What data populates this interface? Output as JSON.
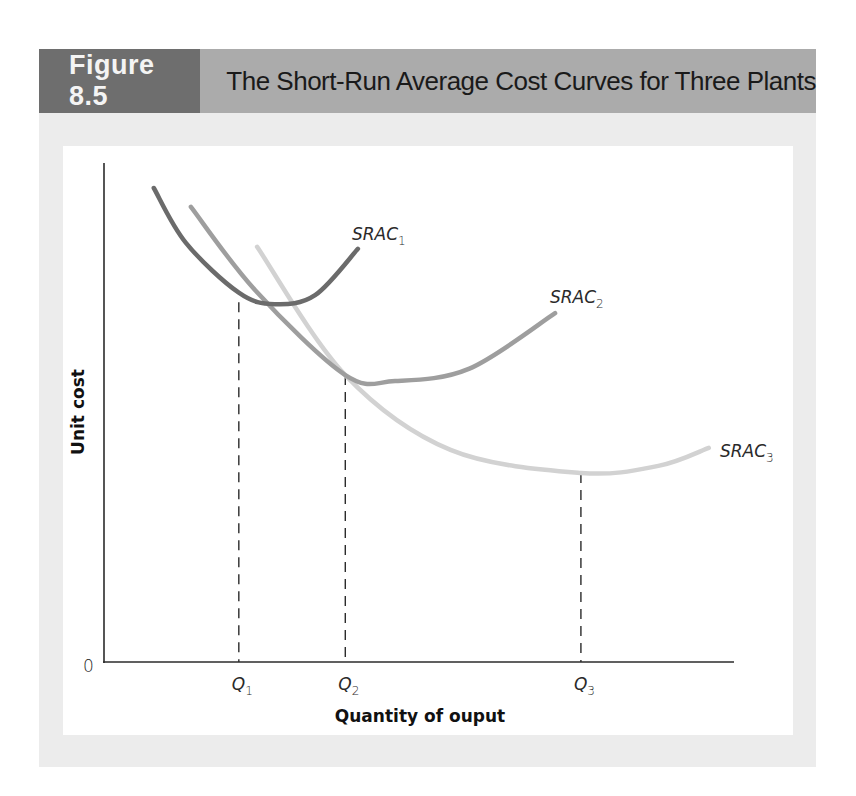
{
  "header": {
    "figure_number": "Figure 8.5",
    "title": "The Short-Run Average Cost Curves for Three Plants"
  },
  "colors": {
    "header_dark": "#6e6e6e",
    "header_light": "#ababab",
    "panel_bg": "#ececec",
    "srac1": "#6b6b6b",
    "srac2": "#9e9e9e",
    "srac3": "#d2d2d2"
  },
  "chart_data": {
    "type": "line",
    "title": "The Short-Run Average Cost Curves for Three Plants",
    "xlabel": "Quantity of ouput",
    "ylabel": "Unit cost",
    "origin_label": "0",
    "xlim": [
      0,
      100
    ],
    "ylim": [
      0,
      100
    ],
    "grid": false,
    "legend": "inline-labels",
    "series": [
      {
        "name": "SRAC",
        "subscript": "1",
        "points": [
          [
            7.9,
            95.0
          ],
          [
            13.0,
            84.0
          ],
          [
            21.4,
            74.0
          ],
          [
            27.1,
            71.7
          ],
          [
            33.5,
            73.5
          ],
          [
            40.3,
            82.8
          ]
        ]
      },
      {
        "name": "SRAC",
        "subscript": "2",
        "points": [
          [
            13.8,
            91.2
          ],
          [
            24.0,
            74.5
          ],
          [
            38.3,
            57.5
          ],
          [
            46.2,
            56.3
          ],
          [
            58.0,
            58.8
          ],
          [
            71.6,
            69.9
          ]
        ]
      },
      {
        "name": "SRAC",
        "subscript": "3",
        "points": [
          [
            24.3,
            83.2
          ],
          [
            38.3,
            57.5
          ],
          [
            55.0,
            42.5
          ],
          [
            75.7,
            37.9
          ],
          [
            88.0,
            39.3
          ],
          [
            96.0,
            42.9
          ]
        ]
      }
    ],
    "reference_lines": [
      {
        "label": "Q",
        "subscript": "1",
        "x": 21.4,
        "y": 72.1
      },
      {
        "label": "Q",
        "subscript": "2",
        "x": 38.3,
        "y": 57.5
      },
      {
        "label": "Q",
        "subscript": "3",
        "x": 75.7,
        "y": 37.9
      }
    ]
  }
}
